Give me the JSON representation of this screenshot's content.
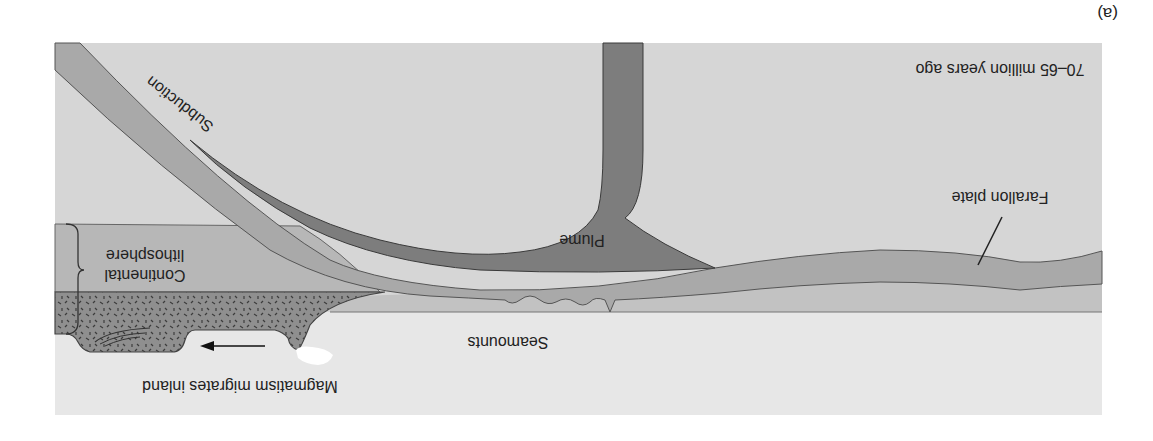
{
  "figure": {
    "panel_label": "(a)",
    "orientation": "rotated-180",
    "time_label": "70–65 million years ago"
  },
  "labels": {
    "subduction": "Subduction",
    "plume": "Plume",
    "farallon_plate": "Farallon plate",
    "continental_lithosphere_line1": "Continental",
    "continental_lithosphere_line2": "lithosphere",
    "seamounts": "Seamounts",
    "magmatism": "Magmatism migrates inland"
  },
  "colors": {
    "mantle": "#d6d6d6",
    "ocean_surface": "#e7e7e7",
    "lithosphere_band": "#bdbdbd",
    "oceanic_plate": "#a9a9a9",
    "plume": "#7d7d7d",
    "magmatic_zone": "#8f8f8f",
    "continental_lithosphere": "#b7b7b7",
    "outline": "#555555",
    "text": "#222222"
  }
}
